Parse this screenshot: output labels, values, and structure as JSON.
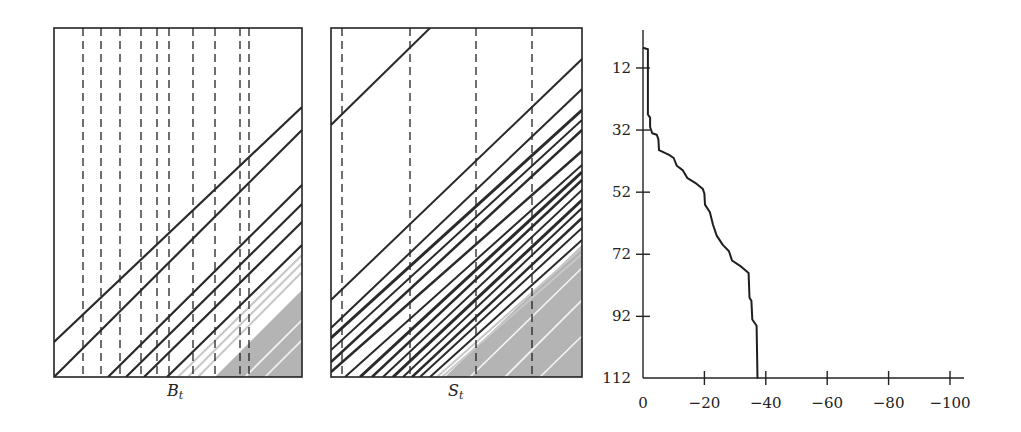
{
  "chart_data": [
    {
      "type": "line",
      "panel": "left",
      "xlabel": "B_t",
      "xlabel_main": "B",
      "xlabel_sub": "t",
      "frame": {
        "x": 54,
        "y": 28,
        "w": 248,
        "h": 349
      },
      "dashed_lines_x": [
        83,
        101,
        120,
        141,
        157,
        169,
        193,
        215,
        240,
        249
      ],
      "diagonal_lines": [
        {
          "x1": 54,
          "y1": 342,
          "x2": 302,
          "y2": 107
        },
        {
          "x1": 54,
          "y1": 377,
          "x2": 302,
          "y2": 130
        },
        {
          "x1": 108,
          "y1": 377,
          "x2": 302,
          "y2": 185
        },
        {
          "x1": 126,
          "y1": 377,
          "x2": 302,
          "y2": 204
        },
        {
          "x1": 144,
          "y1": 377,
          "x2": 302,
          "y2": 222
        },
        {
          "x1": 167,
          "y1": 377,
          "x2": 302,
          "y2": 245
        }
      ],
      "light_lines": [
        {
          "x1": 178,
          "y1": 377,
          "x2": 302,
          "y2": 255
        },
        {
          "x1": 188,
          "y1": 377,
          "x2": 302,
          "y2": 263
        },
        {
          "x1": 198,
          "y1": 377,
          "x2": 302,
          "y2": 272
        }
      ],
      "gray_region": [
        [
          215,
          377
        ],
        [
          302,
          290
        ],
        [
          302,
          377
        ]
      ],
      "gray_white_stripes": [
        {
          "x1": 245,
          "y1": 377,
          "x2": 302,
          "y2": 320
        },
        {
          "x1": 265,
          "y1": 377,
          "x2": 302,
          "y2": 340
        }
      ]
    },
    {
      "type": "line",
      "panel": "middle",
      "xlabel": "S_t",
      "xlabel_main": "S",
      "xlabel_sub": "t",
      "frame": {
        "x": 331,
        "y": 28,
        "w": 251,
        "h": 349
      },
      "dashed_lines_x": [
        342,
        410,
        476,
        532
      ],
      "diagonal_lines": [
        {
          "x1": 331,
          "y1": 125,
          "x2": 430,
          "y2": 28,
          "w": 2
        },
        {
          "x1": 331,
          "y1": 300,
          "x2": 582,
          "y2": 59,
          "w": 2
        },
        {
          "x1": 331,
          "y1": 328,
          "x2": 582,
          "y2": 89,
          "w": 2
        },
        {
          "x1": 331,
          "y1": 338,
          "x2": 582,
          "y2": 110,
          "w": 3
        },
        {
          "x1": 331,
          "y1": 350,
          "x2": 582,
          "y2": 120,
          "w": 2
        },
        {
          "x1": 331,
          "y1": 362,
          "x2": 582,
          "y2": 130,
          "w": 2.5
        },
        {
          "x1": 331,
          "y1": 372,
          "x2": 582,
          "y2": 151,
          "w": 2.5
        },
        {
          "x1": 345,
          "y1": 377,
          "x2": 582,
          "y2": 165,
          "w": 2
        },
        {
          "x1": 360,
          "y1": 377,
          "x2": 582,
          "y2": 172,
          "w": 3
        },
        {
          "x1": 372,
          "y1": 377,
          "x2": 582,
          "y2": 180,
          "w": 2.5
        },
        {
          "x1": 383,
          "y1": 377,
          "x2": 582,
          "y2": 190,
          "w": 2
        },
        {
          "x1": 393,
          "y1": 377,
          "x2": 582,
          "y2": 200,
          "w": 3
        },
        {
          "x1": 403,
          "y1": 377,
          "x2": 582,
          "y2": 208,
          "w": 2
        },
        {
          "x1": 412,
          "y1": 377,
          "x2": 582,
          "y2": 218,
          "w": 2.5
        },
        {
          "x1": 420,
          "y1": 377,
          "x2": 582,
          "y2": 228,
          "w": 2
        },
        {
          "x1": 430,
          "y1": 377,
          "x2": 582,
          "y2": 240,
          "w": 2
        }
      ],
      "light_lines": [
        {
          "x1": 437,
          "y1": 377,
          "x2": 582,
          "y2": 248
        },
        {
          "x1": 442,
          "y1": 377,
          "x2": 582,
          "y2": 254
        }
      ],
      "gray_region": [
        [
          445,
          377
        ],
        [
          582,
          245
        ],
        [
          582,
          377
        ]
      ],
      "gray_white_stripes": [
        {
          "x1": 470,
          "y1": 377,
          "x2": 582,
          "y2": 268
        },
        {
          "x1": 505,
          "y1": 377,
          "x2": 582,
          "y2": 300
        },
        {
          "x1": 540,
          "y1": 377,
          "x2": 582,
          "y2": 336
        }
      ]
    },
    {
      "type": "line",
      "panel": "right",
      "title": "",
      "xlabel": "",
      "ylabel": "",
      "x_ticks": [
        0,
        -20,
        -40,
        -60,
        -80,
        -100
      ],
      "y_ticks": [
        12,
        32,
        52,
        72,
        92,
        112
      ],
      "xlim": [
        0,
        -104
      ],
      "ylim": [
        0,
        112
      ],
      "y_inverted": true,
      "axes": {
        "origin_x": 643,
        "origin_y": 378,
        "top_y": 30,
        "right_x": 964,
        "px_per_x_unit": 3.07,
        "px_per_y_unit": 3.105,
        "y_zero_px": 30.7
      },
      "series": [
        {
          "name": "curve",
          "points": [
            [
              0,
              5.5
            ],
            [
              -1.6,
              6
            ],
            [
              -1.6,
              27
            ],
            [
              -2.3,
              28
            ],
            [
              -2.3,
              31
            ],
            [
              -3,
              33
            ],
            [
              -4.5,
              33.5
            ],
            [
              -5,
              35
            ],
            [
              -5.2,
              38.5
            ],
            [
              -8.5,
              40
            ],
            [
              -10,
              41
            ],
            [
              -11,
              43.5
            ],
            [
              -13,
              45
            ],
            [
              -14.5,
              47.5
            ],
            [
              -17,
              49
            ],
            [
              -19.5,
              51
            ],
            [
              -20,
              52.5
            ],
            [
              -20.2,
              56
            ],
            [
              -21.8,
              58.5
            ],
            [
              -22.8,
              62.5
            ],
            [
              -24,
              66
            ],
            [
              -26,
              69
            ],
            [
              -28,
              71
            ],
            [
              -29,
              74
            ],
            [
              -32,
              76
            ],
            [
              -34.4,
              78
            ],
            [
              -34.7,
              86
            ],
            [
              -35.3,
              87
            ],
            [
              -35.6,
              93
            ],
            [
              -37,
              95
            ],
            [
              -37.3,
              112
            ]
          ]
        }
      ]
    }
  ]
}
